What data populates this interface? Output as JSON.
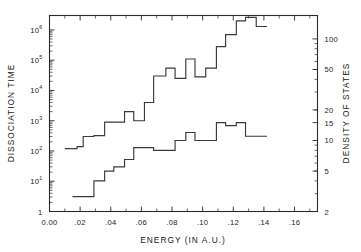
{
  "chart_data": {
    "type": "line",
    "title": "",
    "subtitle": "",
    "xlabel": "ENERGY (IN A.U.)",
    "ylabel": "DISSOCIATION TIME",
    "y2label": "DENSITY OF STATES",
    "grid": false,
    "legend": "none",
    "xlim": [
      0.0,
      0.175
    ],
    "x_ticks": [
      0.0,
      0.02,
      0.04,
      0.06,
      0.08,
      0.1,
      0.12,
      0.14,
      0.16
    ],
    "x_tick_labels": [
      "0.00",
      ".02",
      ".04",
      ".06",
      ".08",
      ".10",
      ".12",
      ".14",
      ".16"
    ],
    "x_minor_ticks": [
      0.01,
      0.03,
      0.05,
      0.07,
      0.09,
      0.11,
      0.13,
      0.15,
      0.17
    ],
    "y_scale": "log",
    "ylim": [
      1,
      3000000
    ],
    "y_ticks": [
      1,
      10,
      100,
      1000,
      10000,
      100000,
      1000000
    ],
    "y_tick_labels": [
      "1",
      "10",
      "10",
      "10",
      "10",
      "10",
      "10"
    ],
    "y_tick_exponents": [
      "",
      "1",
      "2",
      "3",
      "4",
      "5",
      "6"
    ],
    "y2_scale": "log",
    "y2lim": [
      2,
      170
    ],
    "y2_ticks": [
      2,
      5,
      10,
      15,
      20,
      50,
      100
    ],
    "y2_tick_labels": [
      "2",
      "5",
      "10",
      "15",
      "20",
      "50",
      "100"
    ],
    "series": [
      {
        "name": "dissociation-time",
        "axis": "left",
        "type": "step",
        "x": [
          0.01,
          0.018,
          0.022,
          0.029,
          0.036,
          0.049,
          0.055,
          0.062,
          0.068,
          0.076,
          0.082,
          0.089,
          0.095,
          0.102,
          0.109,
          0.115,
          0.122,
          0.128,
          0.135
        ],
        "values": [
          120,
          140,
          300,
          320,
          900,
          2000,
          1000,
          4000,
          30000,
          55000,
          25000,
          110000,
          28000,
          55000,
          280000,
          700000,
          2000000,
          2600000,
          1300000
        ]
      },
      {
        "name": "density-of-states",
        "axis": "right",
        "type": "step",
        "x": [
          0.015,
          0.022,
          0.029,
          0.036,
          0.042,
          0.049,
          0.055,
          0.062,
          0.068,
          0.076,
          0.082,
          0.089,
          0.095,
          0.102,
          0.109,
          0.115,
          0.122,
          0.128,
          0.135
        ],
        "values": [
          2.8,
          2.8,
          4.0,
          5.0,
          5.5,
          6.5,
          8.5,
          8.5,
          8.0,
          8.0,
          10.0,
          12.0,
          10.0,
          10.0,
          15.0,
          14.0,
          15.0,
          11.0,
          11.0
        ]
      }
    ]
  },
  "labels": {
    "y_axis_title": "DISSOCIATION TIME",
    "y2_axis_title": "DENSITY OF STATES",
    "x_axis_title": "ENERGY (IN A.U.)"
  }
}
